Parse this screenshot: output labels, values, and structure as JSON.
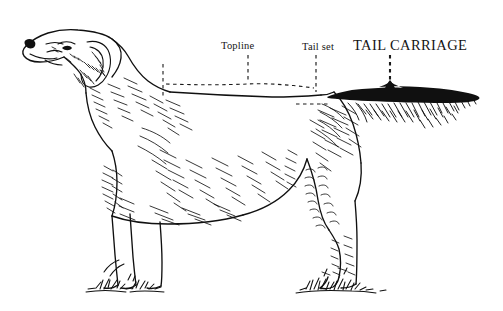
{
  "figure": {
    "type": "anatomical-line-drawing",
    "background_color": "#ffffff",
    "ink_color": "#101010",
    "width": 503,
    "height": 311
  },
  "annotations": {
    "topline": {
      "label": "Topline",
      "style": "small-serif",
      "leader": "vertical-dashed",
      "points_to": "dashed horizontal line along the back"
    },
    "tail_set": {
      "label": "Tail set",
      "style": "small-serif",
      "leader": "vertical-dashed",
      "points_to": "root of tail where it joins the croup"
    },
    "tail_carriage": {
      "label": "TAIL CARRIAGE",
      "style": "large-serif-caps",
      "leader": "vertical-dashed",
      "points_to": "solid black tail silhouette held level with the back"
    }
  },
  "features": {
    "topline_guide": "dashed reference line traced along the back from withers to tail set",
    "withers_tick": "short vertical dashed tick at the withers",
    "croup_tick": "short horizontal dashed tick below the tail set",
    "tail": "filled black tail carried level, with feathering beneath",
    "ground": "two grass tufts beneath the fore and hind feet"
  }
}
